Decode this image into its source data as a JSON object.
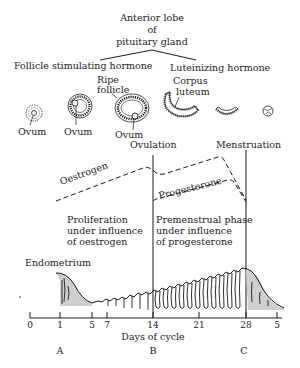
{
  "title": {
    "line1": "Anterior lobe",
    "line2": "of",
    "line3": "pituitary gland"
  },
  "hormones": {
    "fsh": "Follicle stimulating  hormone",
    "lh": "Luteinizing hormone"
  },
  "follicle_labels": {
    "ripe_line1": "Ripe",
    "ripe_line2": "follicle",
    "corpus_line1": "Corpus",
    "corpus_line2": "luteum",
    "ovum": [
      "Ovum",
      "Ovum",
      "Ovum"
    ]
  },
  "events": {
    "ovulation": "Ovulation",
    "menstruation": "Menstruation"
  },
  "curves": {
    "oestrogen": "Oestrogen",
    "progesterone": "Progesterone"
  },
  "phases": {
    "proliferation": [
      "Proliferation",
      "under influence",
      "of oestrogen"
    ],
    "premenstrual": [
      "Premenstrual phase",
      "under influence",
      "of progesterone"
    ]
  },
  "endometrium_label": "Endometrium",
  "axis": {
    "ticks": [
      "0",
      "1",
      "5",
      "7",
      "14",
      "21",
      "28",
      "5"
    ],
    "label": "Days of cycle"
  },
  "markers": [
    "A",
    "B",
    "C"
  ],
  "colors": {
    "ink": "#1a1a1a",
    "stipple": "#9a9a9a",
    "background": "#ffffff"
  }
}
